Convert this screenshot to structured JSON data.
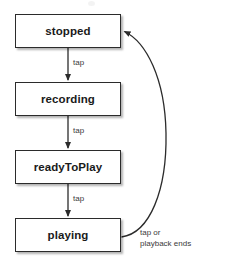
{
  "diagram": {
    "type": "state-machine",
    "title": "",
    "background_color": "#ffffff",
    "box_border_color": "#2b2b2b",
    "text_color": "#1a1a1a",
    "edge_color": "#2b2b2b",
    "edge_label_color": "#3a3a3a",
    "states": [
      {
        "id": "stopped",
        "label": "stopped",
        "x": 15,
        "y": 14,
        "width": 106,
        "height": 34
      },
      {
        "id": "recording",
        "label": "recording",
        "x": 15,
        "y": 82,
        "width": 106,
        "height": 34
      },
      {
        "id": "readyToPlay",
        "label": "readyToPlay",
        "x": 15,
        "y": 150,
        "width": 106,
        "height": 34
      },
      {
        "id": "playing",
        "label": "playing",
        "x": 15,
        "y": 218,
        "width": 106,
        "height": 34
      }
    ],
    "transitions": [
      {
        "id": "stopped-to-recording",
        "from": "stopped",
        "to": "recording",
        "label": "tap",
        "label_x": 73,
        "label_y": 58,
        "shape": "straight-down"
      },
      {
        "id": "recording-to-readytoplay",
        "from": "recording",
        "to": "readyToPlay",
        "label": "tap",
        "label_x": 73,
        "label_y": 126,
        "shape": "straight-down"
      },
      {
        "id": "readytoplay-to-playing",
        "from": "readyToPlay",
        "to": "playing",
        "label": "tap",
        "label_x": 73,
        "label_y": 194,
        "shape": "straight-down"
      },
      {
        "id": "playing-to-stopped",
        "from": "playing",
        "to": "stopped",
        "label": "tap or\nplayback ends",
        "label_x": 140,
        "label_y": 228,
        "shape": "curve-right"
      }
    ]
  }
}
